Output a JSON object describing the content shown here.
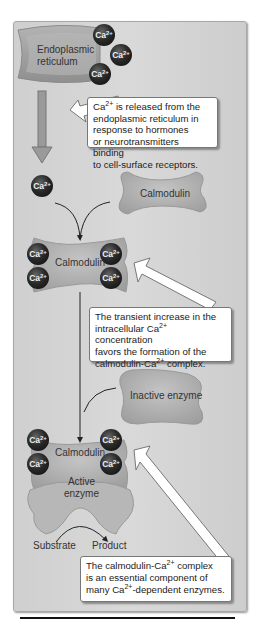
{
  "figure": {
    "type": "biological pathway diagram",
    "color_mode": "grayscale",
    "colors": {
      "background_panel": "#d6d6d6",
      "er_fill": "#a0a0a0",
      "calcium_ion": "#1a1a1a",
      "callout_bg": "#ffffff",
      "arrow": "#333333"
    }
  },
  "labels": {
    "er": [
      "Endoplasmic",
      "reticulum"
    ],
    "ion": "Ca",
    "ion_charge": "2+",
    "calmodulin_free": "Calmodulin",
    "calmodulin_bound": "Calmodulin",
    "calmodulin_enzyme": "Calmodulin",
    "inactive_enzyme": "Inactive enzyme",
    "active_enzyme": [
      "Active",
      "enzyme"
    ],
    "substrate": "Substrate",
    "product": "Product"
  },
  "callouts": [
    {
      "id": "release",
      "lines": [
        "Ca{2+} is released from the",
        "endoplasmic reticulum in",
        "response to hormones",
        "or neurotransmitters binding",
        "to cell-surface receptors."
      ]
    },
    {
      "id": "complex-formation",
      "lines": [
        "The transient increase in the",
        "intracellular Ca{2+} concentration",
        "favors the formation of the",
        "calmodulin-Ca{2+} complex."
      ]
    },
    {
      "id": "enzyme-component",
      "lines": [
        "The calmodulin-Ca{2+} complex",
        "is an essential component of",
        "many Ca{2+}-dependent enzymes."
      ]
    }
  ],
  "ion_count": {
    "at_er": 3,
    "released": 1,
    "bound_to_calmodulin": 4,
    "bound_in_enzyme": 4
  }
}
